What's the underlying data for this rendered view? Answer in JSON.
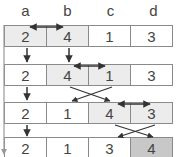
{
  "diagram": {
    "type": "array-sort-steps",
    "columns": [
      "a",
      "b",
      "c",
      "d"
    ],
    "rows": [
      {
        "values": [
          "2",
          "4",
          "1",
          "3"
        ],
        "shading": [
          "light",
          "light",
          "none",
          "none"
        ],
        "swap": "a-b"
      },
      {
        "values": [
          "2",
          "4",
          "1",
          "3"
        ],
        "shading": [
          "none",
          "light",
          "light",
          "none"
        ],
        "swap": "b-c"
      },
      {
        "values": [
          "2",
          "1",
          "4",
          "3"
        ],
        "shading": [
          "none",
          "none",
          "light",
          "light"
        ],
        "swap": "c-d"
      },
      {
        "values": [
          "2",
          "1",
          "3",
          "4"
        ],
        "shading": [
          "none",
          "none",
          "none",
          "dark"
        ],
        "swap": ""
      }
    ],
    "colors": {
      "border": "#8a8a8a",
      "highlight": "#ececec",
      "final": "#c8c8c8",
      "arrow": "#333333",
      "text": "#444444"
    }
  }
}
